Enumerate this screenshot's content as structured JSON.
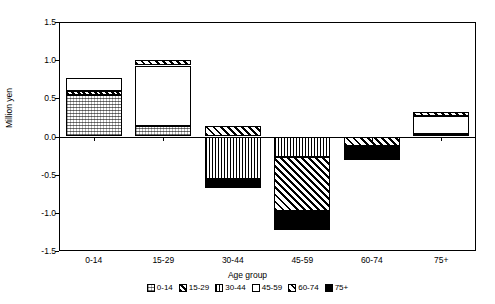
{
  "chart_data": {
    "type": "bar",
    "stacked": true,
    "title": "",
    "xlabel": "Age group",
    "ylabel": "Million yen",
    "ylim": [
      -1.5,
      1.5
    ],
    "ytick_labels": [
      "1.5",
      "1.0",
      "0.5",
      "0.0",
      "-0.5",
      "-1.0",
      "-1.5"
    ],
    "ytick_values": [
      1.5,
      1.0,
      0.5,
      0.0,
      -0.5,
      -1.0,
      -1.5
    ],
    "grid": false,
    "legend_position": "bottom",
    "categories": [
      "0-14",
      "15-29",
      "30-44",
      "45-59",
      "60-74",
      "75+"
    ],
    "series": [
      {
        "name": "0-14",
        "pattern": "fine-dotted",
        "values": [
          0.54,
          0.14,
          0.0,
          0.0,
          0.0,
          0.03
        ]
      },
      {
        "name": "15-29",
        "pattern": "dense-diagonal",
        "values": [
          0.06,
          0.0,
          0.0,
          0.0,
          0.0,
          0.0
        ]
      },
      {
        "name": "30-44",
        "pattern": "vertical-stripes",
        "values": [
          0.0,
          0.0,
          -0.56,
          -0.27,
          0.0,
          0.0
        ]
      },
      {
        "name": "45-59",
        "pattern": "white",
        "values": [
          0.16,
          0.79,
          0.0,
          0.0,
          0.0,
          0.24
        ]
      },
      {
        "name": "60-74",
        "pattern": "diagonal-hatch",
        "values": [
          0.0,
          0.07,
          0.14,
          -0.71,
          -0.13,
          0.05
        ]
      },
      {
        "name": "75+",
        "pattern": "solid-black",
        "values": [
          0.0,
          0.0,
          -0.12,
          -0.24,
          -0.18,
          0.0
        ]
      }
    ],
    "bar_totals_positive": [
      0.76,
      1.0,
      0.14,
      0.14,
      0.0,
      0.32
    ],
    "bar_totals_negative": [
      0.0,
      0.0,
      -0.68,
      -1.22,
      -0.33,
      0.0
    ],
    "annotations": []
  },
  "legend": {
    "items": [
      {
        "label": "0-14"
      },
      {
        "label": "15-29"
      },
      {
        "label": "30-44"
      },
      {
        "label": "45-59"
      },
      {
        "label": "60-74"
      },
      {
        "label": "75+"
      }
    ]
  },
  "colors": {
    "axis": "#000000",
    "plot_background": "#ffffff",
    "figure_background": "#ffffff"
  }
}
